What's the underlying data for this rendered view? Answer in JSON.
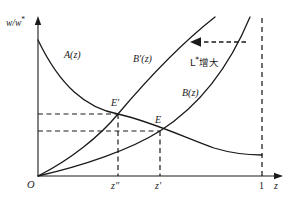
{
  "figure": {
    "axes": {
      "y_label": "w/w*",
      "x_label": "z",
      "origin_label": "O"
    },
    "x_ticks": [
      {
        "name": "z-double-prime",
        "label": "z″",
        "value": 0.36
      },
      {
        "name": "z-prime",
        "label": "z′",
        "value": 0.545
      },
      {
        "name": "one",
        "label": "1",
        "value": 1.0
      }
    ],
    "curves": [
      {
        "name": "A",
        "label": "A(z)",
        "type": "decreasing-convex"
      },
      {
        "name": "B-prime",
        "label": "B′(z)",
        "type": "increasing-convex"
      },
      {
        "name": "B",
        "label": "B(z)",
        "type": "increasing-convex"
      }
    ],
    "points": [
      {
        "name": "E-prime",
        "label": "E′",
        "x": 0.36,
        "y": 0.395
      },
      {
        "name": "E",
        "label": "E",
        "x": 0.545,
        "y": 0.285
      }
    ],
    "annotation": {
      "label": "L*增大",
      "arrow_direction": "left",
      "arrow_style": "dashed"
    },
    "colors": {
      "stroke": "#1a1a1a",
      "background": "#ffffff"
    }
  },
  "chart_data": {
    "type": "line",
    "title": "",
    "xlabel": "z",
    "ylabel": "w/w*",
    "xlim": [
      0,
      1.09
    ],
    "ylim": [
      0,
      1.0
    ],
    "grid": false,
    "legend": "inline-curve-labels",
    "series": [
      {
        "name": "A(z)",
        "label": "A(z)",
        "description": "Decreasing convex curve starting high on the vertical axis and flattening toward the right",
        "x": [
          0.0,
          0.05,
          0.1,
          0.15,
          0.2,
          0.25,
          0.3,
          0.36,
          0.4,
          0.45,
          0.5,
          0.545,
          0.6,
          0.7,
          0.8,
          0.9,
          1.0
        ],
        "y": [
          0.86,
          0.76,
          0.68,
          0.61,
          0.55,
          0.49,
          0.44,
          0.395,
          0.37,
          0.33,
          0.3,
          0.285,
          0.26,
          0.22,
          0.19,
          0.16,
          0.14
        ]
      },
      {
        "name": "B'(z)",
        "label": "B′(z)",
        "description": "Steep increasing convex curve from the origin, intersecting A(z) at E'",
        "x": [
          0.0,
          0.05,
          0.1,
          0.15,
          0.2,
          0.25,
          0.3,
          0.36,
          0.45,
          0.55,
          0.65,
          0.75,
          0.8
        ],
        "y": [
          0.0,
          0.04,
          0.08,
          0.13,
          0.19,
          0.25,
          0.32,
          0.395,
          0.52,
          0.66,
          0.8,
          0.94,
          1.0
        ]
      },
      {
        "name": "B(z)",
        "label": "B(z)",
        "description": "Increasing convex curve from the origin, intersecting A(z) at E",
        "x": [
          0.0,
          0.1,
          0.2,
          0.3,
          0.4,
          0.5,
          0.545,
          0.6,
          0.7,
          0.8,
          0.88,
          0.94
        ],
        "y": [
          0.0,
          0.035,
          0.08,
          0.13,
          0.2,
          0.26,
          0.285,
          0.34,
          0.47,
          0.64,
          0.82,
          1.0
        ]
      }
    ],
    "annotations": [
      {
        "text": "L*增大",
        "x": 0.78,
        "y": 0.76,
        "arrow": "leftward dashed arrow indicating shift of B(z) to B'(z)"
      },
      {
        "text": "E′",
        "x": 0.36,
        "y": 0.395
      },
      {
        "text": "E",
        "x": 0.545,
        "y": 0.285
      }
    ],
    "reference_lines": [
      {
        "name": "vertical-at-one",
        "orientation": "vertical",
        "value": 1.0,
        "style": "dashed"
      },
      {
        "name": "vertical-at-z-double-prime",
        "orientation": "vertical",
        "value": 0.36,
        "style": "dashed"
      },
      {
        "name": "vertical-at-z-prime",
        "orientation": "vertical",
        "value": 0.545,
        "style": "dashed"
      },
      {
        "name": "horizontal-at-E-prime",
        "orientation": "horizontal",
        "value": 0.395,
        "style": "dashed"
      },
      {
        "name": "horizontal-at-E",
        "orientation": "horizontal",
        "value": 0.285,
        "style": "dashed"
      }
    ]
  }
}
